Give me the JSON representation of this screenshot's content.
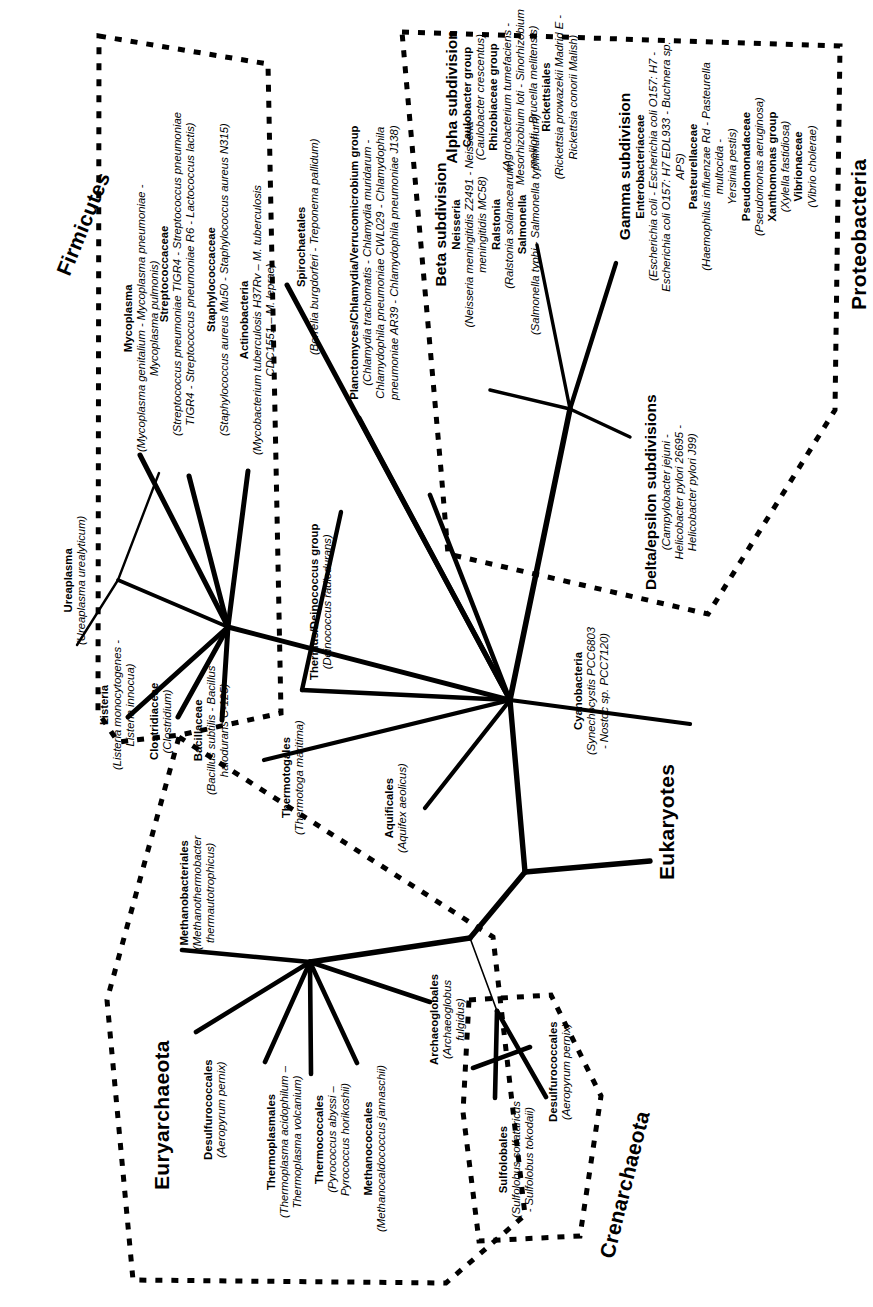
{
  "figure": {
    "type": "unrooted-phylogenetic-tree",
    "orientation": "rotated-90-ccw",
    "background": "#ffffff",
    "line_color": "#000000",
    "dashed_group_border_color": "#000000"
  },
  "domains": {
    "firmicutes": "Firmicutes",
    "proteobacteria": "Proteobacteria",
    "euryarchaeota": "Euryarchaeota",
    "crenarchaeota": "Crenarchaeota",
    "eukaryotes": "Eukaryotes"
  },
  "taxa": {
    "mycoplasma": {
      "name": "Mycoplasma",
      "species": "(Mycoplasma genitalium - Mycoplasma pneumoniae -\nMycoplasma pulmonis)"
    },
    "streptococcaceae": {
      "name": "Streptococcaceae",
      "species": "(Streptococcus pneumoniae TIGR4 - Streptococcus pneumoniae\nTIGR4 - Streptococcus pneumoniae R6 - Lactococcus lactis)"
    },
    "staphylococcaceae": {
      "name": "Staphylococcaceae",
      "species": "(Staphylococcus aureus Mu50 - Staphylococcus aureus N315)"
    },
    "actinobacteria": {
      "name": "Actinobacteria",
      "species": "(Mycobacterium tuberculosis H37Rv – M. tuberculosis\nCDC1551 – M. leprae)"
    },
    "spirochaetales": {
      "name": "Spirochaetales",
      "species": "(Borrelia burgdorferi - Treponema pallidum)"
    },
    "planctomyces": {
      "name": "Planctomyces/Chlamydia/Verrucomicrobium group",
      "species": "(Chlamydia trachomatis - Chlamydia muridarum -\nChlamydophila pneumoniae CWL029 - Chlamydophila\npneumoniae AR39 - Chlamydophila pneumoniae J138)"
    },
    "ureaplasma": {
      "name": "Ureaplasma",
      "species": "(Ureaplasma urealyticum)"
    },
    "listeria": {
      "name": "Listeria",
      "species": "(Listeria monocytogenes -\nListeria innocua)"
    },
    "clostridiaceae": {
      "name": "Clostridiaceae",
      "species": "(Clostridium)"
    },
    "bacillaceae": {
      "name": "Bacillaceae",
      "species": "(Bacillus subtilis - Bacillus\nhalodurans C-125)"
    },
    "thermus_deinococcus": {
      "name": "Thermus/Deinococcus group",
      "species": "(Deinococcus radiodurans)"
    },
    "thermotogales": {
      "name": "Thermotogales",
      "species": "(Thermotoga maritima)"
    },
    "aquificales": {
      "name": "Aquificales",
      "species": "(Aquifex aeolicus)"
    },
    "cyanobacteria": {
      "name": "Cyanobacteria",
      "species": "(Synechocystis PCC6803\n- Nostoc sp. PCC7120)"
    },
    "beta_subdivision": {
      "name": "Beta subdivision",
      "neisseria_name": "Neisseria",
      "neisseria_species": "(Neisseria meningitidis Z2491 - Neisseria\nmeningitidis MC58)",
      "ralstonia_name": "Ralstonia",
      "ralstonia_species": "(Ralstonia solanacearum)",
      "salmonella_name": "Salmonella",
      "salmonella_species": "(Salmonella typhi - Salmonella typhimurium)"
    },
    "alpha_subdivision": {
      "name": "Alpha subdivision",
      "caulobacter_name": "Caulobacter group",
      "caulobacter_species": "(Caulobacter crescentus)",
      "rhizobiaceae_name": "Rhizobiaceae group",
      "rhizobiaceae_species": "(Agrobacterium tumefaciens -\nMesorhizobium loti - Sinorhizobium\nmeliloti - Brucella melitensis)",
      "rickettsiales_name": "Rickettsiales",
      "rickettsiales_species": "(Rickettsia prowazekii Madrid E -\nRickettsia conorii Malish)"
    },
    "gamma_subdivision": {
      "name": "Gamma subdivision",
      "entero_name": "Enterobacteriaceae",
      "entero_species": "(Escherichia coli - Escherichia coli O157: H7 -\nEscherichia coli O157: H7 EDL933 - Buchnera sp. APS)",
      "pasteurellaceae_name": "Pasteurellaceae",
      "pasteurellaceae_species": "(Haemophilus influenzae Rd - Pasteurella multocida -\nYersinia pestis)",
      "pseudomonadaceae_name": "Pseudomonadaceae",
      "pseudomonadaceae_species": "(Pseudomonas aeruginosa)",
      "xanthomonas_name": "Xanthomonas group",
      "xanthomonas_species": "(Xylella fastidiosa)",
      "vibrionaceae_name": "Vibrionaceae",
      "vibrionaceae_species": "(Vibrio cholerae)"
    },
    "delta_epsilon": {
      "name": "Delta/epsilon subdivisions",
      "species": "(Campylobacter jejuni -\nHelicobacter pylori 26695 -\nHelicobacter pylori J99)"
    },
    "methanobacteriales": {
      "name": "Methanobacteriales",
      "species": "(Methanothermobacter\nthermautotrophicus)"
    },
    "desulfurococcales_eury": {
      "name": "Desulfurococcales",
      "species": "(Aeropyrum pernix)"
    },
    "thermoplasmales": {
      "name": "Thermoplasmales",
      "species": "(Thermoplasma acidophilum –\nThermoplasma volcanium)"
    },
    "thermococcales": {
      "name": "Thermococcales",
      "species": "(Pyrococcus abyssi –\nPyrococcus horikoshii)"
    },
    "methanococcales": {
      "name": "Methanococcales",
      "species": "(Methanocaldococcus jannaschii)"
    },
    "archaeoglobales": {
      "name": "Archaeoglobales",
      "species": "(Archaeoglobus\nfulgidus)"
    },
    "sulfolobales": {
      "name": "Sulfolobales",
      "species": "(Sulfolobus solfataricus\n- Sulfolobus tokodaii)"
    },
    "desulfurococcales_cren": {
      "name": "Desulfurococcales",
      "species": "(Aeropyrum pernix)"
    }
  }
}
